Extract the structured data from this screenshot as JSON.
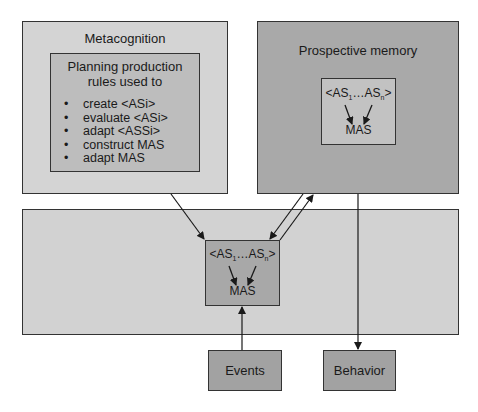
{
  "metacognition": {
    "title": "Metacognition",
    "inner_title_line1": "Planning production",
    "inner_title_line2": "rules used to",
    "rules": [
      "create <ASi>",
      "evaluate <ASi>",
      "adapt <ASSi>",
      "construct MAS",
      "adapt MAS"
    ]
  },
  "prospective_memory": {
    "title": "Prospective memory",
    "sequence_start": "<AS",
    "sub_1": "1",
    "sequence_mid": "…AS",
    "sub_n": "n",
    "sequence_end": ">",
    "mas": "MAS"
  },
  "working_area": {
    "sequence_start": "<AS",
    "sub_1": "1",
    "sequence_mid": "…AS",
    "sub_n": "n",
    "sequence_end": ">",
    "mas": "MAS"
  },
  "events": {
    "label": "Events"
  },
  "behavior": {
    "label": "Behavior"
  },
  "colors": {
    "metacognition_outer": "#d4d4d4",
    "metacognition_inner": "#bdbdbd",
    "prospective_outer": "#a9a9a9",
    "prospective_inner": "#c2c2c2",
    "working_outer": "#d2d2d2",
    "working_inner": "#a8a8a8",
    "io_boxes": "#a2a2a2"
  }
}
